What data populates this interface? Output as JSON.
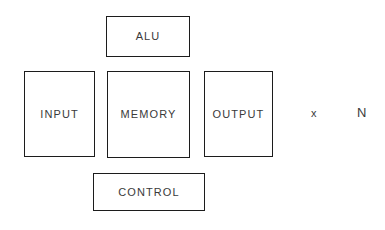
{
  "diagram": {
    "background_color": "#ffffff",
    "stroke_color": "#1c1c1c",
    "text_color": "#3a3a3a",
    "blocks": [
      {
        "id": "alu",
        "label": "ALU"
      },
      {
        "id": "input",
        "label": "INPUT"
      },
      {
        "id": "memory",
        "label": "MEMORY"
      },
      {
        "id": "output",
        "label": "OUTPUT"
      },
      {
        "id": "control",
        "label": "CONTROL"
      }
    ],
    "annotations": [
      {
        "id": "x",
        "label": "x"
      },
      {
        "id": "n",
        "label": "N"
      }
    ]
  }
}
